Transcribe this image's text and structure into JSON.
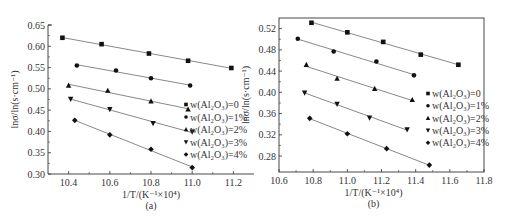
{
  "chart_data": [
    {
      "panel": "(a)",
      "type": "line",
      "title": "",
      "xlabel": "1/T/(K⁻¹×10⁴)",
      "ylabel": "lnσ/ln(s·cm⁻¹)",
      "xlim": [
        10.3,
        11.3
      ],
      "ylim": [
        0.3,
        0.65
      ],
      "xticks": [
        "10.4",
        "10.6",
        "10.8",
        "11.0",
        "11.2"
      ],
      "yticks": [
        "0.30",
        "0.35",
        "0.40",
        "0.45",
        "0.50",
        "0.55",
        "0.60",
        "0.65"
      ],
      "grid": false,
      "legend_position": "right-middle",
      "series": [
        {
          "name": "w(Al₂O₃)=0",
          "marker": "square",
          "x": [
            10.37,
            10.56,
            10.79,
            10.98,
            11.19
          ],
          "y": [
            0.62,
            0.605,
            0.583,
            0.566,
            0.549
          ]
        },
        {
          "name": "w(Al₂O₃)=1%",
          "marker": "circle",
          "x": [
            10.44,
            10.63,
            10.8,
            10.99
          ],
          "y": [
            0.555,
            0.543,
            0.525,
            0.508
          ]
        },
        {
          "name": "w(Al₂O₃)=2%",
          "marker": "triangle-up",
          "x": [
            10.4,
            10.59,
            10.8,
            10.98
          ],
          "y": [
            0.508,
            0.496,
            0.471,
            0.452
          ]
        },
        {
          "name": "w(Al₂O₃)=3%",
          "marker": "triangle-down",
          "x": [
            10.41,
            10.6,
            10.81,
            11.0
          ],
          "y": [
            0.476,
            0.452,
            0.419,
            0.399
          ]
        },
        {
          "name": "w(Al₂O₃)=4%",
          "marker": "diamond",
          "x": [
            10.43,
            10.6,
            10.8,
            11.0
          ],
          "y": [
            0.426,
            0.392,
            0.358,
            0.315
          ]
        }
      ]
    },
    {
      "panel": "(b)",
      "type": "line",
      "title": "",
      "xlabel": "1/T/(K⁻¹×10⁴)",
      "ylabel": "lnσ/ln(s·cm⁻¹)",
      "xlim": [
        10.6,
        11.8
      ],
      "ylim": [
        0.25,
        0.54
      ],
      "xticks": [
        "10.6",
        "10.8",
        "11.0",
        "11.2",
        "11.4",
        "11.6",
        "11.8"
      ],
      "yticks": [
        "0.28",
        "0.32",
        "0.36",
        "0.40",
        "0.44",
        "0.48",
        "0.52"
      ],
      "grid": false,
      "legend_position": "right-middle",
      "series": [
        {
          "name": "w(Al₂O₃)=0",
          "marker": "square",
          "x": [
            10.79,
            11.0,
            11.21,
            11.43,
            11.65
          ],
          "y": [
            0.531,
            0.513,
            0.495,
            0.471,
            0.452
          ]
        },
        {
          "name": "w(Al₂O₃)=1%",
          "marker": "circle",
          "x": [
            10.71,
            10.92,
            11.17,
            11.39
          ],
          "y": [
            0.501,
            0.477,
            0.458,
            0.432
          ]
        },
        {
          "name": "w(Al₂O₃)=2%",
          "marker": "triangle-up",
          "x": [
            10.76,
            10.94,
            11.16,
            11.38
          ],
          "y": [
            0.452,
            0.426,
            0.407,
            0.386
          ]
        },
        {
          "name": "w(Al₂O₃)=3%",
          "marker": "triangle-down",
          "x": [
            10.75,
            10.94,
            11.13,
            11.35
          ],
          "y": [
            0.399,
            0.378,
            0.352,
            0.33
          ]
        },
        {
          "name": "w(Al₂O₃)=4%",
          "marker": "diamond",
          "x": [
            10.78,
            11.0,
            11.23,
            11.48
          ],
          "y": [
            0.351,
            0.322,
            0.294,
            0.263
          ]
        }
      ]
    }
  ],
  "colors": {
    "axis": "#333333",
    "line": "#555555",
    "marker": "#111111",
    "background": "#ffffff"
  },
  "layout": [
    {
      "left": 48,
      "right": 254,
      "top": 25,
      "bottom": 174,
      "frame": "L-shape"
    },
    {
      "left": 279,
      "right": 484,
      "top": 18,
      "bottom": 172,
      "frame": "box"
    }
  ]
}
